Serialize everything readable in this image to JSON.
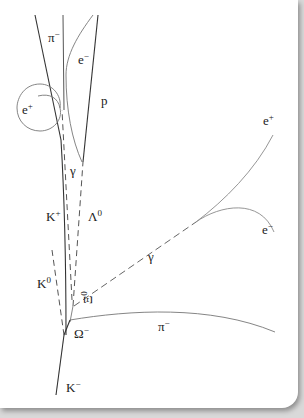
{
  "diagram": {
    "colors": {
      "background": "#ffffff",
      "frame_shadow": "#d9d9d9",
      "track_charged": "#333333",
      "track_light": "#8a8a8a",
      "label": "#222222"
    },
    "labels": {
      "pi_minus_top": {
        "base": "π",
        "sup": "−"
      },
      "e_minus_top": {
        "base": "e",
        "sup": "−"
      },
      "e_plus_left": {
        "base": "e",
        "sup": "+"
      },
      "p": {
        "base": "p",
        "sup": ""
      },
      "gamma_upper": {
        "base": "γ",
        "sup": ""
      },
      "k_plus": {
        "base": "K",
        "sup": "+"
      },
      "lambda_zero": {
        "base": "Λ",
        "sup": "0"
      },
      "e_plus_right": {
        "base": "e",
        "sup": "+"
      },
      "e_minus_right": {
        "base": "e",
        "sup": "−"
      },
      "gamma_lower": {
        "base": "γ",
        "sup": ""
      },
      "k_zero": {
        "base": "K",
        "sup": "0"
      },
      "xi_zero": {
        "base": "Ξ",
        "sup": "0"
      },
      "omega_minus": {
        "base": "Ω",
        "sup": "−"
      },
      "pi_minus_right": {
        "base": "π",
        "sup": "−"
      },
      "k_minus": {
        "base": "K",
        "sup": "−"
      }
    },
    "legend": {
      "solid_line": "charged particle track",
      "dashed_line": "neutral particle path"
    }
  }
}
